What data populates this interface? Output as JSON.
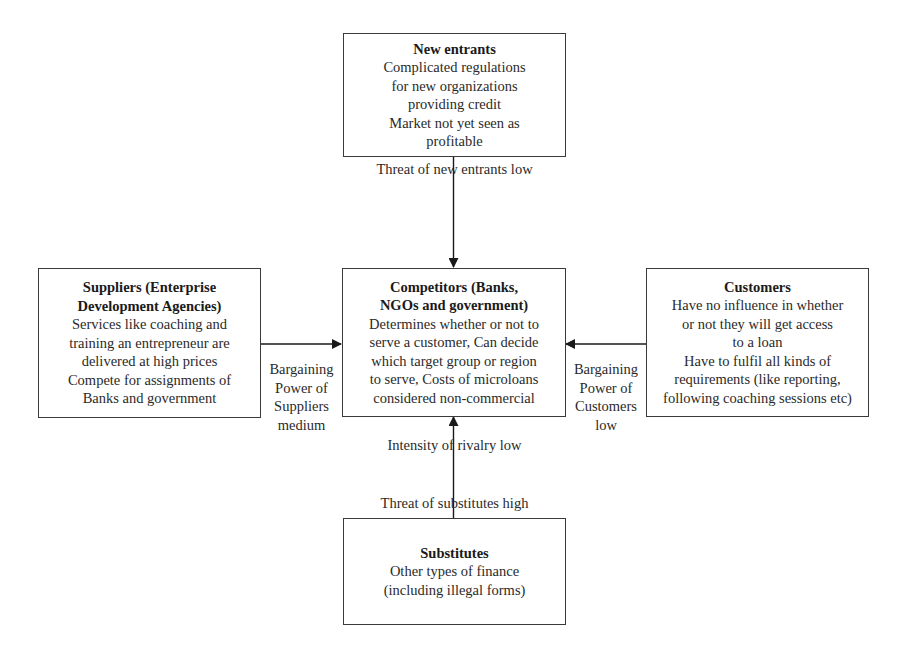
{
  "diagram": {
    "type": "porters-five-forces",
    "boxes": {
      "new_entrants": {
        "title_lines": [
          "New entrants"
        ],
        "body_lines": [
          "Complicated regulations",
          "for new organizations",
          "providing credit",
          "Market not yet seen as",
          "profitable"
        ]
      },
      "competitors": {
        "title_lines": [
          "Competitors (Banks,",
          "NGOs and government)"
        ],
        "body_lines": [
          "Determines whether or not to",
          "serve a customer, Can decide",
          "which target group or region",
          "to serve, Costs of microloans",
          "considered non-commercial"
        ]
      },
      "suppliers": {
        "title_lines": [
          "Suppliers (Enterprise",
          "Development Agencies)"
        ],
        "body_lines": [
          "Services like coaching and",
          "training an entrepreneur are",
          "delivered at high prices",
          "Compete for assignments of",
          "Banks and government"
        ]
      },
      "customers": {
        "title_lines": [
          "Customers"
        ],
        "body_lines": [
          "Have no influence in whether",
          "or not they will get access",
          "to a loan",
          "Have to fulfil all kinds of",
          "requirements (like reporting,",
          "following coaching sessions etc)"
        ]
      },
      "substitutes": {
        "title_lines": [
          "Substitutes"
        ],
        "body_lines": [
          "Other types of finance",
          "(including illegal forms)"
        ]
      }
    },
    "labels": {
      "threat_new_entrants": "Threat of new entrants low",
      "suppliers_power": [
        "Bargaining",
        "Power of",
        "Suppliers",
        "medium"
      ],
      "customers_power": [
        "Bargaining",
        "Power of",
        "Customers",
        "low"
      ],
      "rivalry": "Intensity of rivalry low",
      "threat_substitutes": "Threat of substitutes high"
    },
    "colors": {
      "line": "#1a1a1a",
      "text": "#2a2a2a",
      "background": "#ffffff"
    }
  }
}
